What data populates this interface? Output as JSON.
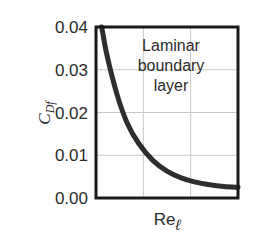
{
  "chart_data": {
    "type": "line",
    "title": "",
    "xlabel": "Re",
    "xlabel_subscript": "ℓ",
    "ylabel": "C",
    "ylabel_subscript": "Df",
    "ylim": [
      0.0,
      0.04
    ],
    "yticks": [
      "0.00",
      "0.01",
      "0.02",
      "0.03",
      "0.04"
    ],
    "xticks": [],
    "grid": true,
    "legend": null,
    "annotation": [
      "Laminar",
      "boundary",
      "layer"
    ],
    "series": [
      {
        "name": "Laminar boundary layer",
        "x": [
          0.04,
          0.08,
          0.15,
          0.22,
          0.3,
          0.4,
          0.5,
          0.6,
          0.7,
          0.8,
          0.9,
          1.0
        ],
        "values": [
          0.04,
          0.033,
          0.024,
          0.0175,
          0.0128,
          0.0088,
          0.0063,
          0.0047,
          0.0037,
          0.0031,
          0.0027,
          0.0025
        ]
      }
    ],
    "colors": {
      "curve": "#2e2e2e",
      "frame": "#1a1a1a",
      "grid": "#c8c8c8"
    }
  }
}
